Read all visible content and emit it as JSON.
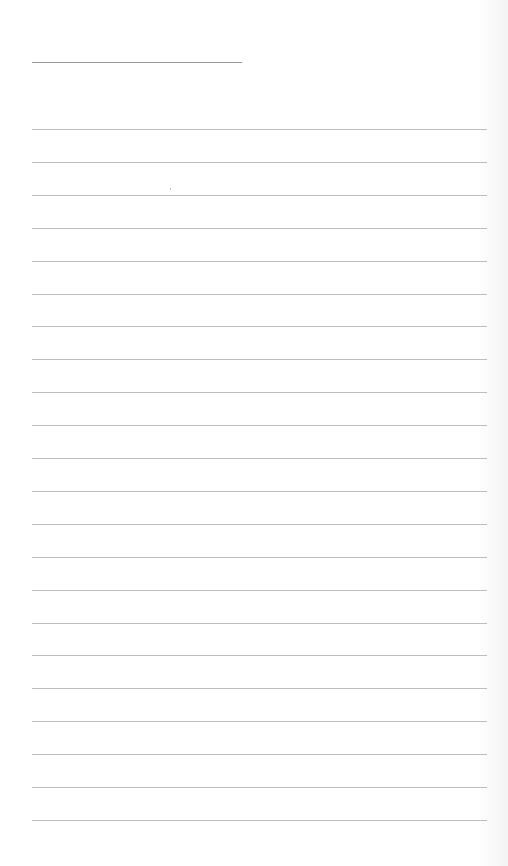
{
  "page": {
    "type": "ruled-lined-paper",
    "background_color": "#ffffff",
    "line_color": "#bdbdbd",
    "header_line": {
      "label": "",
      "x": 32,
      "y": 62,
      "width": 210
    },
    "rules": {
      "count": 22,
      "first_y": 129,
      "spacing": 32.9,
      "x": 32,
      "width": 455
    }
  }
}
